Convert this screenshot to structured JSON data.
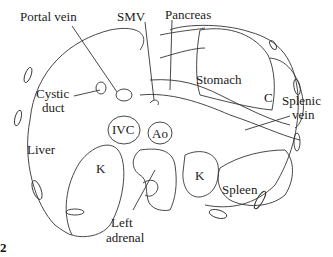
{
  "figure": {
    "number": "2",
    "labels": {
      "portal_vein": "Portal vein",
      "smv": "SMV",
      "pancreas": "Pancreas",
      "cystic_duct_1": "Cystic",
      "cystic_duct_2": "duct",
      "stomach": "Stomach",
      "c": "C",
      "splenic_vein_1": "Splenic",
      "splenic_vein_2": "vein",
      "ivc": "IVC",
      "ao": "Ao",
      "liver": "Liver",
      "k_right": "K",
      "k_left": "K",
      "spleen": "Spleen",
      "left_adrenal_1": "Left",
      "left_adrenal_2": "adrenal"
    }
  }
}
